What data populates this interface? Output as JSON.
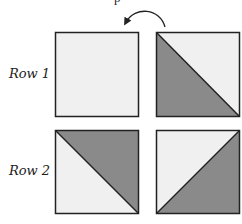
{
  "diagram": {
    "top_text_fragment": "p",
    "rotation_arrow": "counter-clockwise-arrow",
    "colors": {
      "light": "#f0f0f0",
      "dark": "#8a8a8a",
      "stroke": "#222222"
    },
    "rows": [
      {
        "label": "Row 1",
        "squares": [
          {
            "type": "plain",
            "fill": "light"
          },
          {
            "type": "half-triangle",
            "diagonal": "top-left-to-bottom-right",
            "dark_half": "lower-left"
          }
        ]
      },
      {
        "label": "Row 2",
        "squares": [
          {
            "type": "half-triangle",
            "diagonal": "top-left-to-bottom-right",
            "dark_half": "upper-right"
          },
          {
            "type": "half-triangle",
            "diagonal": "bottom-left-to-top-right",
            "dark_half": "lower-right"
          }
        ]
      }
    ]
  }
}
